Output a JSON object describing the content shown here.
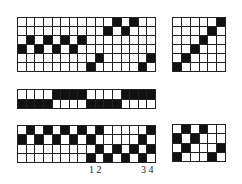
{
  "diagram": {
    "type": "weaving-draft",
    "colors": {
      "filled": "#111111",
      "empty": "#ffffff",
      "grid_line": "#222222"
    },
    "panels": [
      {
        "id": "threading",
        "cols": 16,
        "rows": 6,
        "box": {
          "x": 17,
          "y": 17,
          "w": 139,
          "h": 55
        },
        "filled": [
          [
            11,
            13
          ],
          [
            10,
            12
          ],
          [
            1,
            3,
            5,
            7
          ],
          [
            0,
            2,
            4,
            6
          ],
          [
            9,
            15
          ],
          [
            8,
            14
          ]
        ]
      },
      {
        "id": "tie-up",
        "cols": 6,
        "rows": 6,
        "box": {
          "x": 172,
          "y": 17,
          "w": 54,
          "h": 55
        },
        "filled": [
          [
            5
          ],
          [
            4
          ],
          [
            3
          ],
          [
            2
          ],
          [
            1
          ],
          [
            0
          ]
        ]
      },
      {
        "id": "treadling-strip",
        "cols": 16,
        "rows": 2,
        "box": {
          "x": 17,
          "y": 89,
          "w": 139,
          "h": 20
        },
        "filled": [
          [
            4,
            5,
            6,
            7,
            12,
            13,
            14,
            15
          ],
          [
            0,
            1,
            2,
            3,
            8,
            9,
            10,
            11
          ]
        ]
      },
      {
        "id": "drawdown",
        "cols": 16,
        "rows": 4,
        "box": {
          "x": 17,
          "y": 125,
          "w": 139,
          "h": 38
        },
        "filled": [
          [
            1,
            3,
            5,
            7,
            9,
            15
          ],
          [
            0,
            2,
            4,
            6,
            8,
            14
          ],
          [
            9,
            11,
            13,
            15
          ],
          [
            8,
            10,
            12,
            14
          ]
        ]
      },
      {
        "id": "drawdown-detail",
        "cols": 6,
        "rows": 4,
        "box": {
          "x": 172,
          "y": 124,
          "w": 54,
          "h": 38
        },
        "filled": [
          [
            1,
            3
          ],
          [
            0,
            2
          ],
          [
            1,
            5
          ],
          [
            0,
            4
          ]
        ]
      }
    ],
    "labels": [
      {
        "text": "1 2",
        "x": 89,
        "y": 165
      },
      {
        "text": "3 4",
        "x": 141,
        "y": 165
      }
    ]
  }
}
